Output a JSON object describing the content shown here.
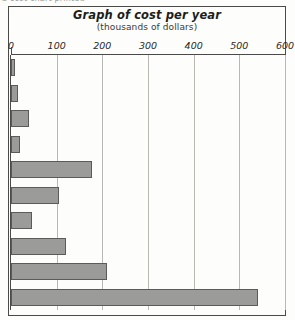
{
  "page": {
    "top_caption": "a cost chart printed"
  },
  "chart": {
    "title": "Graph of cost per year",
    "subtitle": "(thousands of dollars)"
  },
  "chart_data": {
    "type": "bar",
    "orientation": "horizontal",
    "title": "Graph of cost per year",
    "subtitle": "(thousands of dollars)",
    "xlabel": "",
    "ylabel": "",
    "xlim": [
      0,
      600
    ],
    "xticks": [
      0,
      100,
      200,
      300,
      400,
      500,
      600
    ],
    "xtick_labels": [
      "0",
      "100",
      "200",
      "300",
      "400",
      "500",
      "600"
    ],
    "grid": true,
    "grid_axis": "x",
    "legend": false,
    "bar_color": "#9b9b99",
    "bar_edge_color": "#5b5b59",
    "categories": [
      "",
      "",
      "",
      "",
      "",
      "",
      "",
      "",
      "",
      ""
    ],
    "values": [
      8,
      15,
      40,
      20,
      178,
      105,
      45,
      120,
      210,
      540
    ]
  }
}
